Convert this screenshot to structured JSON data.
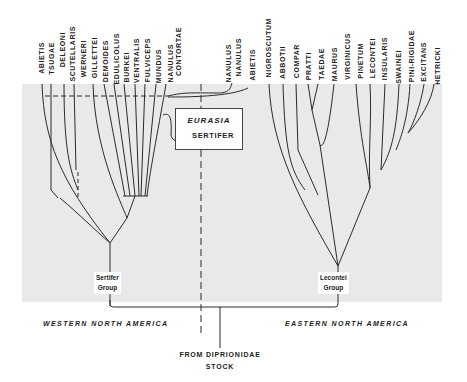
{
  "western_taxa": [
    "ABIETIS",
    "TSUGAE",
    "DELEONI",
    "SCUTELLARIS",
    "WERNERI",
    "GILLETTEI",
    "DEMOIDES",
    "EDULICOLUS",
    "BURKEI",
    "VENTRALIS",
    "FULVICEPS",
    "MUNDUS",
    "NANULUS",
    "CONTORTAE"
  ],
  "middle_taxa": [
    "NANULUS",
    "NANULUS",
    "ABIETIS"
  ],
  "eastern_taxa": [
    "NIGROSCUTUM",
    "ABBOTII",
    "COMPAR",
    "PRATTI",
    "TAEDAE",
    "MAURUS",
    "VIRGINICUS",
    "PINETUM",
    "LECONTEI",
    "INSULARIS",
    "SWAINEI",
    "PINI-RIGIDAE",
    "EXCITANS",
    "HETRICKI"
  ],
  "eurasia_box": {
    "title": "EURASIA",
    "species": "SERTIFER"
  },
  "groups": {
    "west": [
      "Sertifer",
      "Group"
    ],
    "east": [
      "Lecontei",
      "Group"
    ]
  },
  "regions": {
    "west": "WESTERN NORTH AMERICA",
    "east": "EASTERN NORTH AMERICA"
  },
  "origin": [
    "FROM DIPRIONIDAE",
    "STOCK"
  ],
  "colors": {
    "panel": "#e9e9e9",
    "line": "#2a2a2a"
  }
}
